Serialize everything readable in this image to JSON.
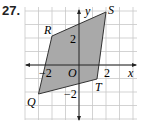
{
  "problem_number": "27.",
  "graph": {
    "x_axis_label": "x",
    "y_axis_label": "y",
    "origin_label": "O",
    "tick_labels": {
      "x_pos": "2",
      "x_neg": "−2",
      "y_pos": "2",
      "y_neg": "−2"
    },
    "grid": {
      "x_min": -4,
      "x_max": 4,
      "y_min": -4,
      "y_max": 4
    },
    "colors": {
      "fill": "#a9a9a9",
      "grid": "#c8c8c8",
      "axis": "#222222"
    },
    "vertices": [
      {
        "label": "Q",
        "x": -3,
        "y": -3
      },
      {
        "label": "R",
        "x": -2,
        "y": 2
      },
      {
        "label": "S",
        "x": 2,
        "y": 3
      },
      {
        "label": "T",
        "x": 1,
        "y": -1
      }
    ]
  }
}
